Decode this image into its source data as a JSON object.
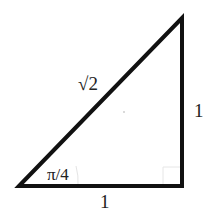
{
  "diagram": {
    "type": "right-triangle",
    "labels": {
      "hypotenuse": "√2",
      "vertical_leg": "1",
      "horizontal_leg": "1",
      "angle": "π/4"
    },
    "colors": {
      "stroke": "#111111",
      "background": "#ffffff",
      "text": "#222222"
    }
  }
}
